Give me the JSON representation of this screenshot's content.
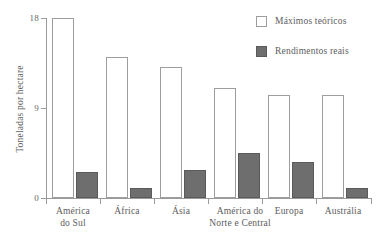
{
  "chart_data": {
    "type": "bar",
    "title": "",
    "subtitle": "",
    "xlabel": "",
    "ylabel": "Toneladas por hectare",
    "categories": [
      "América do Sul",
      "África",
      "Ásia",
      "América do Norte e Central",
      "Europa",
      "Austrália"
    ],
    "category_lines": [
      [
        "América",
        "do Sul"
      ],
      [
        "África"
      ],
      [
        "Ásia"
      ],
      [
        "América do",
        "Norte e Central"
      ],
      [
        "Europa"
      ],
      [
        "Austrália"
      ]
    ],
    "series": [
      {
        "name": "Máximos teóricos",
        "color": "#ffffff",
        "values": [
          18.0,
          14.1,
          13.1,
          11.0,
          10.3,
          10.3
        ]
      },
      {
        "name": "Rendimentos reais",
        "color": "#6e6e6e",
        "values": [
          2.6,
          1.0,
          2.8,
          4.5,
          3.6,
          1.0
        ]
      }
    ],
    "ylim": [
      0,
      18
    ],
    "yticks": [
      0,
      9,
      18
    ],
    "ytick_labels": [
      "0",
      "9",
      "18"
    ],
    "grid": false,
    "legend_position": "top-right"
  },
  "axis": {
    "y_label": "Toneladas por hectare",
    "y_ticks": [
      "18",
      "9",
      "0"
    ]
  },
  "legend": {
    "items": [
      {
        "label": "Máximos teóricos",
        "swatch": "hollow-square-icon"
      },
      {
        "label": "Rendimentos reais",
        "swatch": "filled-square-icon"
      }
    ]
  },
  "x_labels": [
    {
      "line1": "América",
      "line2": "do Sul"
    },
    {
      "line1": "África",
      "line2": ""
    },
    {
      "line1": "Ásia",
      "line2": ""
    },
    {
      "line1": "América do",
      "line2": "Norte e Central"
    },
    {
      "line1": "Europa",
      "line2": ""
    },
    {
      "line1": "Austrália",
      "line2": ""
    }
  ]
}
